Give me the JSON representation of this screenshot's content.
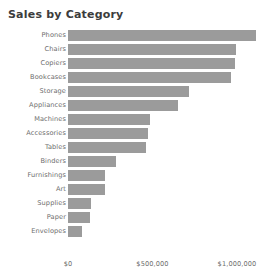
{
  "chart": {
    "title": "Sales by Category"
  },
  "axis": {
    "ticks": [
      {
        "label": "$0",
        "value": 0
      },
      {
        "label": "$500,000",
        "value": 500000
      },
      {
        "label": "$1,000,000",
        "value": 1000000
      }
    ]
  },
  "style": {
    "bar_color": "#9b9b9b",
    "title_color": "#3c3c3c",
    "label_color": "#6e6e6e",
    "background": "#ffffff"
  },
  "chart_data": {
    "type": "bar",
    "orientation": "horizontal",
    "title": "Sales by Category",
    "xlabel": "",
    "ylabel": "",
    "xlim": [
      0,
      1120000
    ],
    "grid": false,
    "legend": false,
    "categories": [
      "Phones",
      "Chairs",
      "Copiers",
      "Bookcases",
      "Storage",
      "Appliances",
      "Machines",
      "Accessories",
      "Tables",
      "Binders",
      "Furnishings",
      "Art",
      "Supplies",
      "Paper",
      "Envelopes"
    ],
    "values": [
      1112000,
      994000,
      988000,
      964000,
      716000,
      651000,
      485000,
      473000,
      462000,
      284000,
      219000,
      219000,
      136000,
      130000,
      83000
    ],
    "xticks": [
      0,
      500000,
      1000000
    ],
    "xticklabels": [
      "$0",
      "$500,000",
      "$1,000,000"
    ]
  }
}
